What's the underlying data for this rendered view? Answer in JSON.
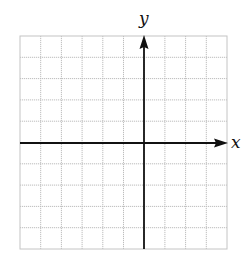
{
  "diagram": {
    "type": "coordinate-grid",
    "x_axis_label": "x",
    "y_axis_label": "y",
    "grid": {
      "columns": 10,
      "rows": 10
    },
    "origin_cell": {
      "col": 6,
      "row": 5
    },
    "colors": {
      "grid": "#bdbdbd",
      "axis": "#111111",
      "background": "#ffffff"
    }
  }
}
